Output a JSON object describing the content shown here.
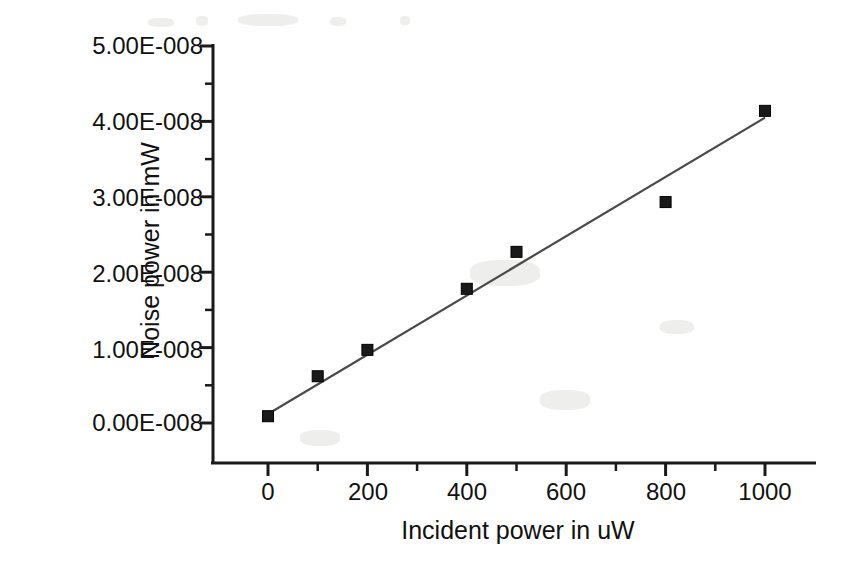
{
  "chart_data": {
    "type": "scatter",
    "title": "",
    "xlabel": "Incident power in uW",
    "ylabel": "Noise power in mW",
    "x": [
      0,
      100,
      200,
      400,
      500,
      800,
      1000
    ],
    "values": [
      9e-10,
      6.2e-09,
      9.7e-09,
      1.78e-08,
      2.27e-08,
      2.93e-08,
      4.14e-08
    ],
    "series": [
      {
        "name": "Measured noise power",
        "marker": "filled-square",
        "color": "#1a1a1a",
        "x": [
          0,
          100,
          200,
          400,
          500,
          800,
          1000
        ],
        "values": [
          9e-10,
          6.2e-09,
          9.7e-09,
          1.78e-08,
          2.27e-08,
          2.93e-08,
          4.14e-08
        ]
      },
      {
        "name": "Linear fit",
        "marker": "none",
        "style": "line",
        "color": "#4a4a4a",
        "x": [
          0,
          1000
        ],
        "values": [
          1.2e-09,
          4.05e-08
        ]
      }
    ],
    "xlim": [
      -60,
      1100
    ],
    "ylim": [
      -7e-09,
      5.2e-08
    ],
    "xticks": [
      0,
      200,
      400,
      600,
      800,
      1000
    ],
    "xtick_labels": [
      "0",
      "200",
      "400",
      "600",
      "800",
      "1000"
    ],
    "xminor_ticks": [
      100,
      300,
      500,
      700,
      900
    ],
    "yticks": [
      0,
      1e-08,
      2e-08,
      3e-08,
      4e-08,
      5e-08
    ],
    "ytick_labels": [
      "0.00E-008",
      "1.00E-008",
      "2.00E-008",
      "3.00E-008",
      "4.00E-008",
      "5.00E-008"
    ],
    "yminor_ticks": [
      5e-09,
      1.5e-08,
      2.5e-08,
      3.5e-08,
      4.5e-08
    ],
    "grid": false,
    "legend": "none",
    "axis_style": "left-and-bottom-spines",
    "background_color": "#ffffff",
    "axis_color": "#1a1a1a"
  },
  "axes": {
    "y_title": "Noise power in mW",
    "x_title": "Incident power in uW"
  }
}
